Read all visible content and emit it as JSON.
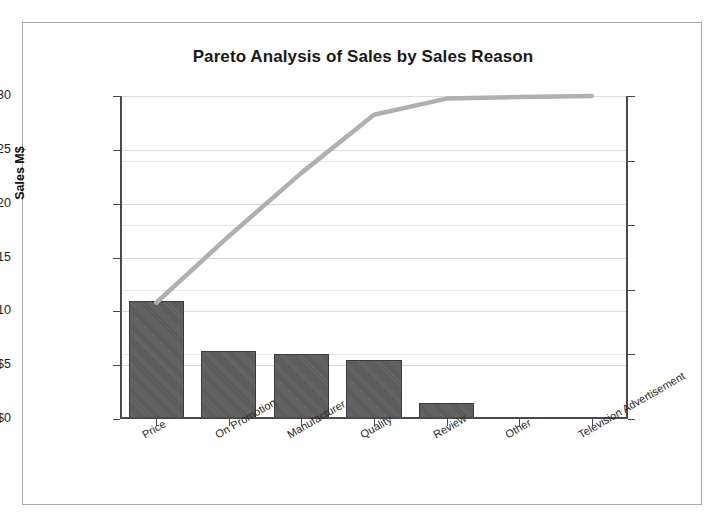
{
  "chart_data": {
    "type": "bar",
    "title": "Pareto Analysis of Sales by Sales Reason",
    "xlabel": "",
    "ylabel": "Sales M$",
    "y2label": "",
    "categories": [
      "Price",
      "On Promotion",
      "Manufacturer",
      "Quality",
      "Review",
      "Other",
      "Television Advertisement"
    ],
    "values": [
      11.0,
      6.3,
      6.0,
      5.5,
      1.5,
      0.15,
      0.1
    ],
    "series": [
      {
        "name": "Sales M$",
        "type": "bar",
        "values": [
          11.0,
          6.3,
          6.0,
          5.5,
          1.5,
          0.15,
          0.1
        ]
      },
      {
        "name": "Cumulative %",
        "type": "line",
        "values": [
          36.0,
          56.6,
          76.2,
          94.2,
          99.2,
          99.7,
          100.0
        ]
      }
    ],
    "ylim": [
      0,
      30
    ],
    "ylim2": [
      0,
      100
    ],
    "yticks": [
      0,
      5,
      10,
      15,
      20,
      25,
      30
    ],
    "ytick_labels": [
      "$0",
      "$5",
      "$10",
      "$15",
      "$20",
      "$25",
      "$30"
    ],
    "y2ticks": [
      0,
      20,
      40,
      60,
      80,
      100
    ],
    "y2tick_labels": [
      "0 %",
      "20 %",
      "40 %",
      "60 %",
      "80 %",
      "100 %"
    ],
    "grid": true,
    "legend": "none",
    "bar_color": "#5c5c5c",
    "bar_edge_color": "#3a3a3a",
    "line_color": "#b0b0b0",
    "title_color": "#1a1a1a",
    "axis_color": "#4a4a4a",
    "grid_color": "#dcdcdc",
    "background_color": "#ffffff",
    "frame_color": "#a8a8a8"
  }
}
